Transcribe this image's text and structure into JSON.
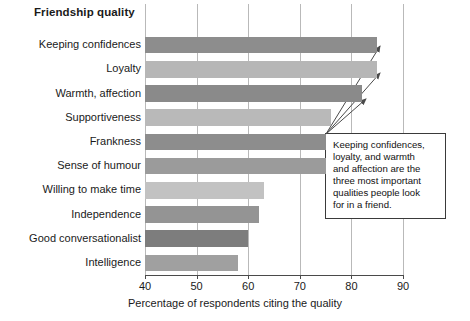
{
  "chart_data": {
    "type": "bar",
    "orientation": "horizontal",
    "title": "Friendship quality",
    "xlabel": "Percentage of respondents citing the quality",
    "ylabel": "",
    "xlim": [
      40,
      90
    ],
    "xticks": [
      40,
      50,
      60,
      70,
      80,
      90
    ],
    "grid": true,
    "legend": null,
    "categories": [
      "Keeping confidences",
      "Loyalty",
      "Warmth, affection",
      "Supportiveness",
      "Frankness",
      "Sense of humour",
      "Willing to make time",
      "Independence",
      "Good conversationalist",
      "Intelligence"
    ],
    "values": [
      85,
      85,
      82,
      76,
      75,
      75,
      63,
      62,
      60,
      58
    ],
    "bar_colors": [
      "#8d8d8d",
      "#b6b6b6",
      "#8a8a8a",
      "#b9b9b9",
      "#8d8d8d",
      "#9b9b9b",
      "#c2c2c2",
      "#949494",
      "#7d7d7d",
      "#a0a0a0"
    ],
    "annotations": [
      {
        "text": "Keeping confidences, loyalty, and warmth and affection are the three most important qualities people look for in a friend.",
        "lines": [
          "Keeping confidences,",
          "loyalty, and warmth",
          "and affection are the",
          "three most important",
          "qualities people look",
          "for in a friend."
        ],
        "points_to": [
          "Keeping confidences",
          "Loyalty",
          "Warmth, affection"
        ]
      }
    ]
  },
  "axis": {
    "tick_labels": [
      "40",
      "50",
      "60",
      "70",
      "80",
      "90"
    ],
    "x_title": "Percentage of respondents citing the quality"
  },
  "header": {
    "title": "Friendship quality"
  },
  "annotation": {
    "line1": "Keeping confidences,",
    "line2": "loyalty, and warmth",
    "line3": "and affection are the",
    "line4": "three most important",
    "line5": "qualities people look",
    "line6": "for in a friend."
  }
}
